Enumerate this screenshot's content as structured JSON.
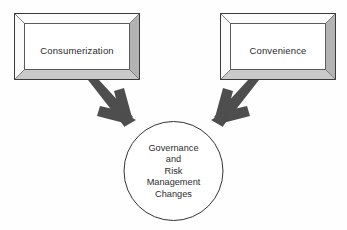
{
  "diagram": {
    "background_color": "#fefefe",
    "boxes": [
      {
        "id": "consumerization",
        "label": "Consumerization",
        "x": 14,
        "y": 13,
        "width": 126,
        "height": 67,
        "fill": "#ffffff",
        "bevel_light": "#fdfdfd",
        "bevel_dark": "#b3b3b3",
        "bevel_bottom": "#c9c9c9",
        "stroke": "#3a3a3a"
      },
      {
        "id": "convenience",
        "label": "Convenience",
        "x": 220,
        "y": 13,
        "width": 116,
        "height": 67,
        "fill": "#ffffff",
        "bevel_light": "#fdfdfd",
        "bevel_dark": "#b3b3b3",
        "bevel_bottom": "#c9c9c9",
        "stroke": "#3a3a3a"
      }
    ],
    "circle": {
      "id": "governance-risk-management-changes",
      "cx": 173.5,
      "cy": 171,
      "r": 49.5,
      "fill": "#ffffff",
      "stroke": "#333333",
      "lines": [
        "Governance",
        "and",
        "Risk",
        "Management",
        "Changes"
      ]
    },
    "arrows": [
      {
        "id": "arrow-consumerization-to-circle",
        "from": "consumerization",
        "to": "governance-risk-management-changes",
        "direction": "down-right",
        "color": "#4a4a4a"
      },
      {
        "id": "arrow-convenience-to-circle",
        "from": "convenience",
        "to": "governance-risk-management-changes",
        "direction": "down-left",
        "color": "#4a4a4a"
      }
    ]
  }
}
